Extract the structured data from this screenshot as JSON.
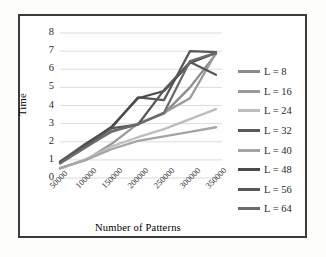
{
  "chart_data": {
    "type": "line",
    "title": "",
    "xlabel": "Number of Patterns",
    "ylabel": "Time",
    "categories": [
      "50000",
      "100000",
      "150000",
      "200000",
      "250000",
      "300000",
      "350000"
    ],
    "x_values": [
      50000,
      100000,
      150000,
      200000,
      250000,
      300000,
      350000
    ],
    "y_ticks": [
      "0",
      "1",
      "2",
      "3",
      "4",
      "5",
      "6",
      "7",
      "8"
    ],
    "ylim": [
      0,
      8
    ],
    "grid": "horizontal",
    "legend_position": "right",
    "series": [
      {
        "name": "L = 8",
        "color": "#8c8c8c",
        "values": [
          0.85,
          1.75,
          2.55,
          3.0,
          3.55,
          5.0,
          6.85
        ]
      },
      {
        "name": "L = 16",
        "color": "#9a9a9a",
        "values": [
          0.55,
          1.0,
          1.9,
          3.0,
          3.6,
          4.4,
          6.9
        ]
      },
      {
        "name": "L = 24",
        "color": "#bdbdbd",
        "values": [
          0.5,
          1.05,
          1.75,
          2.25,
          2.7,
          3.25,
          3.8
        ]
      },
      {
        "name": "L = 32",
        "color": "#595959",
        "values": [
          0.9,
          1.9,
          2.8,
          4.45,
          4.3,
          7.0,
          6.95
        ]
      },
      {
        "name": "L = 40",
        "color": "#a5a5a5",
        "values": [
          0.55,
          1.0,
          1.6,
          2.05,
          2.3,
          2.55,
          2.8
        ]
      },
      {
        "name": "L = 48",
        "color": "#4a4a4a",
        "values": [
          0.85,
          1.85,
          2.85,
          4.4,
          4.8,
          6.35,
          6.9
        ]
      },
      {
        "name": "L = 56",
        "color": "#585858",
        "values": [
          0.9,
          1.8,
          2.75,
          2.95,
          4.85,
          6.4,
          5.7
        ]
      },
      {
        "name": "L = 64",
        "color": "#6b6b6b",
        "values": [
          0.8,
          1.7,
          2.6,
          2.95,
          3.6,
          6.45,
          6.9
        ]
      }
    ]
  },
  "legend": {
    "items": [
      {
        "label": "L = 8"
      },
      {
        "label": "L = 16"
      },
      {
        "label": "L = 24"
      },
      {
        "label": "L = 32"
      },
      {
        "label": "L = 40"
      },
      {
        "label": "L = 48"
      },
      {
        "label": "L = 56"
      },
      {
        "label": "L = 64"
      }
    ]
  },
  "axes": {
    "y_title": "Time",
    "x_title": "Number of Patterns"
  },
  "colors": {
    "frame": "#3b3b3b",
    "gridline": "#d9d9d9",
    "text": "#2a2a2a",
    "background": "#fefefe"
  }
}
